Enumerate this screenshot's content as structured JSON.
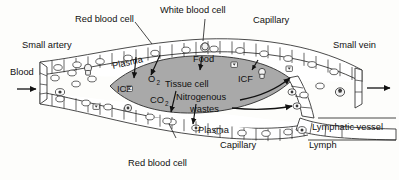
{
  "diagram": {
    "background_color": "#fdfdfb",
    "ink_color": "#111111",
    "tissue_cell_color": "#a9a9a9",
    "vessel_fill_color": "#ffffff"
  },
  "labels": {
    "red_blood_cell_top": "Red blood cell",
    "white_blood_cell": "White blood cell",
    "capillary_top": "Capillary",
    "small_artery": "Small artery",
    "small_vein": "Small vein",
    "plasma_top": "Plasma",
    "blood_in": "Blood",
    "food": "Food",
    "tissue_cell": "Tissue cell",
    "icf_left": "ICF",
    "icf_right": "ICF",
    "oxygen": "O",
    "oxygen_sub": "2",
    "carbon_dioxide": "CO",
    "carbon_dioxide_sub": "2",
    "nitrogenous_wastes_line1": "Nitrogenous",
    "nitrogenous_wastes_line2": "wastes",
    "plasma_bottom": "Plasma",
    "capillary_bottom": "Capillary",
    "red_blood_cell_bottom": "Red blood cell",
    "lymphatic_vessel": "Lymphatic vessel",
    "lymph": "Lymph"
  },
  "icons": {
    "blood_inflow_arrow": "arrow-right-icon",
    "blood_outflow_arrow": "arrow-right-icon",
    "lymph_cell_glyph": "lymph-cell-icon",
    "icf_marker_glyph": "icf-marker-icon"
  }
}
